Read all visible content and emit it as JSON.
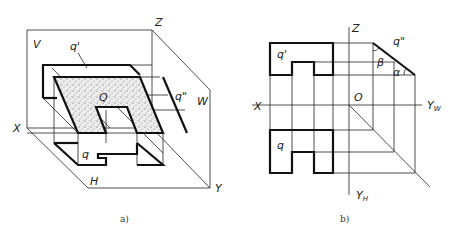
{
  "figure_a": {
    "caption": "a)",
    "labels": {
      "V": "V",
      "Z": "Z",
      "W": "W",
      "X": "X",
      "H": "H",
      "Y": "Y",
      "q_prime": "q'",
      "q_double_prime": "q\"",
      "q": "q",
      "Q": "Q"
    },
    "fill_color": "#d9d9d9"
  },
  "figure_b": {
    "caption": "b)",
    "labels": {
      "Z": "Z",
      "X": "X",
      "O": "O",
      "Yw": "Y",
      "Yw_sub": "W",
      "Yh": "Y",
      "Yh_sub": "H",
      "q_prime": "q'",
      "q_double_prime": "q\"",
      "q": "q",
      "beta": "β",
      "alpha": "α"
    }
  }
}
